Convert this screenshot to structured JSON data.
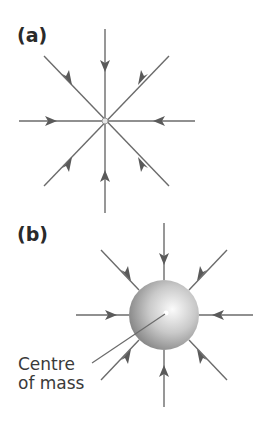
{
  "figure": {
    "panels": [
      {
        "label": "(a)",
        "description": "Radial field lines converging on a point mass",
        "center": [
          105,
          121
        ],
        "line_count": 8,
        "arrow_direction": "inward"
      },
      {
        "label": "(b)",
        "description": "Radial field lines converging on a spherical mass",
        "center": [
          164,
          315
        ],
        "sphere_radius": 35,
        "line_count": 8,
        "arrow_direction": "inward",
        "annotation": {
          "line1": "Centre",
          "line2": "of mass"
        }
      }
    ],
    "colors": {
      "line": "#6b6b6b",
      "arrow": "#5a5a5a",
      "sphere_light": "#f4f4f4",
      "sphere_dark": "#7a7a7a",
      "text": "#2a2a2a"
    }
  }
}
